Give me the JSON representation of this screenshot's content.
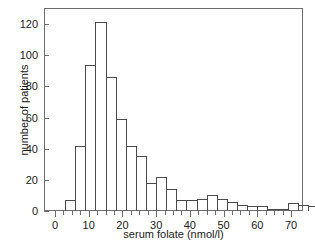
{
  "chart_data": {
    "type": "bar",
    "title": "",
    "subtitle": "",
    "xlabel": "serum folate (nmol/l)",
    "ylabel": "number of patients",
    "xlim": [
      -1.5,
      76
    ],
    "ylim": [
      0,
      136
    ],
    "grid": false,
    "legend": null,
    "bin_width": 3,
    "x_major_ticks": [
      0,
      10,
      20,
      30,
      40,
      50,
      60,
      70
    ],
    "x_major_tick_labels": [
      "0",
      "10",
      "20",
      "30",
      "40",
      "50",
      "60",
      "70"
    ],
    "x_minor_tick_step": 2.5,
    "y_major_ticks": [
      0,
      20,
      40,
      60,
      80,
      100,
      120
    ],
    "y_major_tick_labels": [
      "0",
      "20",
      "40",
      "60",
      "80",
      "100",
      "120"
    ],
    "bin_starts": [
      3,
      6,
      9,
      12,
      15,
      18,
      21,
      24,
      27,
      30,
      33,
      36,
      39,
      42,
      45,
      48,
      51,
      54,
      57,
      60,
      63,
      66
    ],
    "categories": [
      "3-6",
      "6-9",
      "9-12",
      "12-15",
      "15-18",
      "18-21",
      "21-24",
      "24-27",
      "27-30",
      "30-33",
      "33-36",
      "36-39",
      "39-42",
      "42-45",
      "45-48",
      "48-51",
      "51-54",
      "54-57",
      "57-60",
      "60-63",
      "63-66",
      "66-69"
    ],
    "values": [
      7,
      42,
      94,
      121,
      86,
      59,
      42,
      35,
      18,
      22,
      14,
      7,
      7,
      8,
      10,
      8,
      6,
      4,
      3,
      3,
      1,
      1
    ],
    "values_tail": [
      5,
      4,
      3,
      4,
      5,
      1
    ],
    "bars": [
      {
        "x0": 3,
        "x1": 6,
        "count": 7
      },
      {
        "x0": 6,
        "x1": 9,
        "count": 42
      },
      {
        "x0": 9,
        "x1": 12,
        "count": 94
      },
      {
        "x0": 12,
        "x1": 15,
        "count": 121
      },
      {
        "x0": 15,
        "x1": 18,
        "count": 86
      },
      {
        "x0": 18,
        "x1": 21,
        "count": 59
      },
      {
        "x0": 21,
        "x1": 24,
        "count": 42
      },
      {
        "x0": 24,
        "x1": 27,
        "count": 35
      },
      {
        "x0": 27,
        "x1": 30,
        "count": 18
      },
      {
        "x0": 30,
        "x1": 33,
        "count": 22
      },
      {
        "x0": 33,
        "x1": 36,
        "count": 14
      },
      {
        "x0": 36,
        "x1": 39,
        "count": 7
      },
      {
        "x0": 39,
        "x1": 42,
        "count": 7
      },
      {
        "x0": 42,
        "x1": 45,
        "count": 8
      },
      {
        "x0": 45,
        "x1": 48,
        "count": 10
      },
      {
        "x0": 48,
        "x1": 51,
        "count": 8
      },
      {
        "x0": 51,
        "x1": 54,
        "count": 6
      },
      {
        "x0": 54,
        "x1": 57,
        "count": 4
      },
      {
        "x0": 57,
        "x1": 60,
        "count": 3
      },
      {
        "x0": 60,
        "x1": 63,
        "count": 3
      },
      {
        "x0": 63,
        "x1": 66,
        "count": 1
      },
      {
        "x0": 66,
        "x1": 69,
        "count": 1
      },
      {
        "x0": 69,
        "x1": 72,
        "count": 5
      },
      {
        "x0": 72,
        "x1": 75,
        "count": 4
      }
    ],
    "bars_plotted": [
      {
        "x0": 3,
        "x1": 6,
        "count": 7
      },
      {
        "x0": 6,
        "x1": 9,
        "count": 42
      },
      {
        "x0": 9,
        "x1": 12,
        "count": 94
      },
      {
        "x0": 12,
        "x1": 15,
        "count": 121
      },
      {
        "x0": 15,
        "x1": 18,
        "count": 86
      },
      {
        "x0": 18,
        "x1": 21,
        "count": 59
      },
      {
        "x0": 21,
        "x1": 24,
        "count": 42
      },
      {
        "x0": 24,
        "x1": 27,
        "count": 35
      },
      {
        "x0": 27,
        "x1": 30,
        "count": 18
      },
      {
        "x0": 30,
        "x1": 33,
        "count": 22
      },
      {
        "x0": 33,
        "x1": 36,
        "count": 14
      },
      {
        "x0": 36,
        "x1": 39,
        "count": 7
      },
      {
        "x0": 39,
        "x1": 42,
        "count": 7
      },
      {
        "x0": 42,
        "x1": 45,
        "count": 8
      },
      {
        "x0": 45,
        "x1": 48,
        "count": 10
      },
      {
        "x0": 48,
        "x1": 51,
        "count": 8
      },
      {
        "x0": 51,
        "x1": 54,
        "count": 6
      },
      {
        "x0": 54,
        "x1": 57,
        "count": 4
      },
      {
        "x0": 57,
        "x1": 60,
        "count": 3
      },
      {
        "x0": 60,
        "x1": 63,
        "count": 3
      },
      {
        "x0": 63,
        "x1": 66,
        "count": 1
      },
      {
        "x0": 66,
        "x1": 69,
        "count": 1
      },
      {
        "x0": 69,
        "x1": 72,
        "count": 5
      },
      {
        "x0": 72,
        "x1": 75,
        "count": 4
      },
      {
        "x0": 75,
        "x1": 78,
        "count": 3
      }
    ],
    "bar_color": "#ffffff",
    "bar_edge_color": "#4a4a4a",
    "axis_color": "#6d6d6d",
    "text_color": "#1a1a1a",
    "background_color": "#ffffff"
  }
}
